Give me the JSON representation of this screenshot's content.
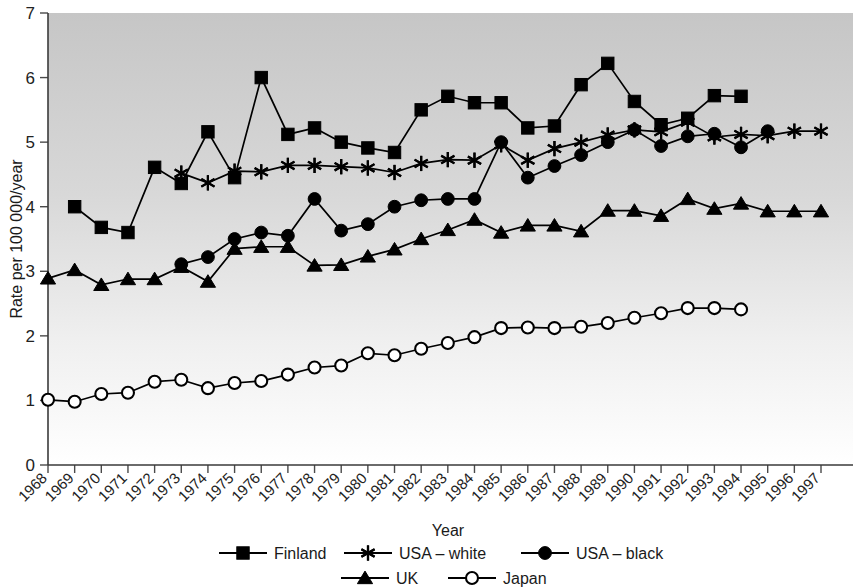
{
  "chart_data": {
    "type": "line",
    "title": "",
    "xlabel": "Year",
    "ylabel": "Rate per 100 000/year",
    "x": [
      1968,
      1969,
      1970,
      1971,
      1972,
      1973,
      1974,
      1975,
      1976,
      1977,
      1978,
      1979,
      1980,
      1981,
      1982,
      1983,
      1984,
      1985,
      1986,
      1987,
      1988,
      1989,
      1990,
      1991,
      1992,
      1993,
      1994,
      1995,
      1996,
      1997
    ],
    "categories": [
      "1968",
      "1969",
      "1970",
      "1971",
      "1972",
      "1973",
      "1974",
      "1975",
      "1976",
      "1977",
      "1978",
      "1979",
      "1980",
      "1981",
      "1982",
      "1983",
      "1984",
      "1985",
      "1986",
      "1987",
      "1988",
      "1989",
      "1990",
      "1991",
      "1992",
      "1993",
      "1994",
      "1995",
      "1996",
      "1997"
    ],
    "xlim": [
      1968,
      1997
    ],
    "ylim": [
      0,
      7
    ],
    "yticks": [
      0,
      1,
      2,
      3,
      4,
      5,
      6,
      7
    ],
    "grid": false,
    "legend_position": "bottom",
    "series": [
      {
        "name": "Finland",
        "marker": "filled-square",
        "start_year": 1969,
        "values": [
          null,
          4.0,
          3.68,
          3.6,
          4.61,
          4.36,
          5.16,
          4.45,
          6.0,
          5.12,
          5.22,
          5.0,
          4.91,
          4.84,
          5.5,
          5.71,
          5.61,
          5.61,
          5.22,
          5.25,
          5.89,
          6.22,
          5.63,
          5.27,
          5.37,
          5.72,
          5.71,
          null,
          null,
          null
        ]
      },
      {
        "name": "USA – white",
        "marker": "asterisk",
        "start_year": 1973,
        "values": [
          null,
          null,
          null,
          null,
          null,
          4.52,
          4.37,
          4.55,
          4.54,
          4.64,
          4.64,
          4.62,
          4.6,
          4.53,
          4.67,
          4.73,
          4.72,
          4.96,
          4.72,
          4.9,
          5.0,
          5.11,
          5.19,
          5.16,
          5.31,
          5.08,
          5.12,
          5.1,
          5.17,
          5.17
        ]
      },
      {
        "name": "USA – black",
        "marker": "filled-circle",
        "start_year": 1973,
        "values": [
          null,
          null,
          null,
          null,
          null,
          3.11,
          3.22,
          3.5,
          3.6,
          3.55,
          4.12,
          3.63,
          3.73,
          4.0,
          4.1,
          4.12,
          4.12,
          5.0,
          4.45,
          4.63,
          4.8,
          5.0,
          5.19,
          4.94,
          5.09,
          5.13,
          4.92,
          5.17,
          null,
          null
        ]
      },
      {
        "name": "UK",
        "marker": "filled-triangle",
        "start_year": 1968,
        "values": [
          2.89,
          3.02,
          2.79,
          2.88,
          2.88,
          3.07,
          2.84,
          3.35,
          3.38,
          3.38,
          3.09,
          3.1,
          3.23,
          3.34,
          3.5,
          3.64,
          3.8,
          3.6,
          3.71,
          3.71,
          3.62,
          3.94,
          3.94,
          3.86,
          4.12,
          3.97,
          4.05,
          3.93,
          3.93,
          3.93
        ]
      },
      {
        "name": "Japan",
        "marker": "open-circle",
        "start_year": 1968,
        "values": [
          1.01,
          0.98,
          1.1,
          1.12,
          1.29,
          1.32,
          1.19,
          1.27,
          1.3,
          1.4,
          1.51,
          1.54,
          1.73,
          1.7,
          1.8,
          1.89,
          1.98,
          2.12,
          2.13,
          2.12,
          2.14,
          2.2,
          2.28,
          2.35,
          2.43,
          2.43,
          2.41,
          null,
          null,
          null
        ]
      }
    ]
  },
  "axes": {
    "y_title": "Rate per 100 000/year",
    "x_title": "Year"
  },
  "legend": {
    "row1": [
      {
        "label": "Finland",
        "marker": "filled-square"
      },
      {
        "label": "USA – white",
        "marker": "asterisk"
      },
      {
        "label": "USA – black",
        "marker": "filled-circle"
      }
    ],
    "row2": [
      {
        "label": "UK",
        "marker": "filled-triangle"
      },
      {
        "label": "Japan",
        "marker": "open-circle"
      }
    ]
  },
  "colors": {
    "ink": "#000000",
    "axis": "#3a3a3a",
    "plot_top": "#c9c9c9",
    "plot_bottom": "#ffffff",
    "page_background": "#ffffff"
  }
}
